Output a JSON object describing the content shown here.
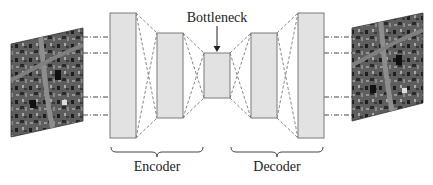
{
  "diagram": {
    "type": "autoencoder-architecture",
    "labels": {
      "bottleneck": "Bottleneck",
      "encoder": "Encoder",
      "decoder": "Decoder"
    },
    "images": {
      "input": "aerial-satellite-image-input",
      "output": "aerial-satellite-image-reconstruction"
    },
    "layers": [
      {
        "group": "encoder",
        "x": 110,
        "y": 13,
        "w": 26,
        "h": 125
      },
      {
        "group": "encoder",
        "x": 157,
        "y": 33,
        "w": 26,
        "h": 85
      },
      {
        "group": "bottleneck",
        "x": 204,
        "y": 53,
        "w": 26,
        "h": 45
      },
      {
        "group": "decoder",
        "x": 251,
        "y": 33,
        "w": 26,
        "h": 85
      },
      {
        "group": "decoder",
        "x": 298,
        "y": 13,
        "w": 26,
        "h": 125
      }
    ],
    "colors": {
      "layer_fill": "#e2e2e2",
      "layer_stroke": "#7a7a7a",
      "dash": "#777777",
      "connector": "#333333",
      "text": "#222222"
    }
  }
}
